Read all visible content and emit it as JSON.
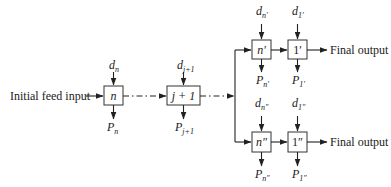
{
  "diagram": {
    "type": "process-flow",
    "input_label": "Initial feed input",
    "stages": [
      {
        "id": "n",
        "label": "n",
        "feed": "d",
        "feed_sub": "n",
        "product": "P",
        "product_sub": "n"
      },
      {
        "id": "j+1",
        "label": "j + 1",
        "feed": "d",
        "feed_sub": "j+1",
        "product": "P",
        "product_sub": "j+1"
      }
    ],
    "branches": [
      {
        "name": "upper",
        "stages": [
          {
            "id": "n'",
            "label": "n′",
            "feed": "d",
            "feed_sub": "n′",
            "product": "P",
            "product_sub": "n′"
          },
          {
            "id": "1'",
            "label": "1′",
            "feed": "d",
            "feed_sub": "1′",
            "product": "P",
            "product_sub": "1′"
          }
        ],
        "output_label": "Final output"
      },
      {
        "name": "lower",
        "stages": [
          {
            "id": "n''",
            "label": "n″",
            "feed": "d",
            "feed_sub": "n″",
            "product": "P",
            "product_sub": "n″"
          },
          {
            "id": "1''",
            "label": "1″",
            "feed": "d",
            "feed_sub": "1″",
            "product": "P",
            "product_sub": "1″"
          }
        ],
        "output_label": "Final output"
      }
    ],
    "connectors": [
      {
        "from": "input",
        "to": "n",
        "style": "solid"
      },
      {
        "from": "n",
        "to": "j+1",
        "style": "dash-dot"
      },
      {
        "from": "j+1",
        "to": "split",
        "style": "dash-dot"
      },
      {
        "from": "split",
        "to": "n'",
        "style": "solid"
      },
      {
        "from": "split",
        "to": "n''",
        "style": "solid"
      },
      {
        "from": "n'",
        "to": "1'",
        "style": "solid"
      },
      {
        "from": "n''",
        "to": "1''",
        "style": "solid"
      },
      {
        "from": "1'",
        "to": "output",
        "style": "solid"
      },
      {
        "from": "1''",
        "to": "output",
        "style": "solid"
      }
    ]
  }
}
